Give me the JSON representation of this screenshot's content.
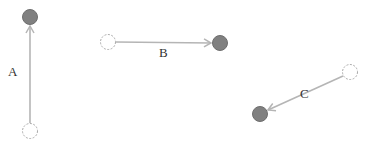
{
  "colors": {
    "line": "#b5b5b5",
    "filled": "#808080",
    "filled_stroke": "#6e6e6e",
    "hollow_stroke": "#aaaaaa",
    "text": "#333333"
  },
  "arrows": [
    {
      "label": "A",
      "from": [
        30,
        131
      ],
      "to": [
        30,
        17
      ],
      "label_pos": [
        8,
        64
      ]
    },
    {
      "label": "B",
      "from": [
        108,
        42
      ],
      "to": [
        220,
        43
      ],
      "label_pos": [
        159,
        45
      ]
    },
    {
      "label": "C",
      "from": [
        350,
        72
      ],
      "to": [
        260,
        114
      ],
      "label_pos": [
        300,
        86
      ]
    }
  ]
}
